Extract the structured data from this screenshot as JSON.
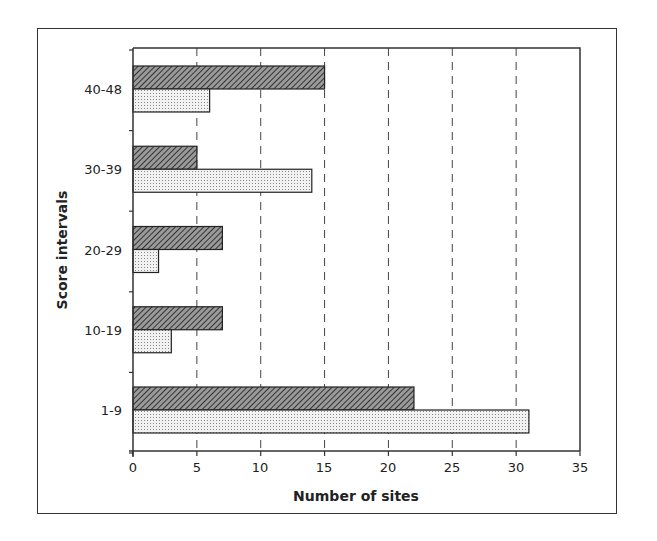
{
  "chart_data": {
    "type": "bar",
    "orientation": "horizontal",
    "title": "",
    "xlabel": "Number of sites",
    "ylabel": "Score intervals",
    "categories": [
      "40-48",
      "30-39",
      "20-29",
      "10-19",
      "1-9"
    ],
    "series": [
      {
        "name": "Series 1 (hatched)",
        "pattern": "diagonal-hatch",
        "color": "#6e6e6e",
        "values": [
          15,
          5,
          7,
          7,
          22
        ]
      },
      {
        "name": "Series 2 (dotted)",
        "pattern": "dots",
        "color": "#e4e4e4",
        "values": [
          6,
          14,
          2,
          3,
          31
        ]
      }
    ],
    "xlim": [
      0,
      35
    ],
    "xticks": [
      0,
      5,
      10,
      15,
      20,
      25,
      30,
      35
    ],
    "grid": "vertical dashed",
    "legend": "none"
  },
  "labels": {
    "xlabel": "Number of sites",
    "ylabel": "Score intervals",
    "categories": [
      "40-48",
      "30-39",
      "20-29",
      "10-19",
      "1-9"
    ],
    "xticks": [
      "0",
      "5",
      "10",
      "15",
      "20",
      "25",
      "30",
      "35"
    ]
  }
}
